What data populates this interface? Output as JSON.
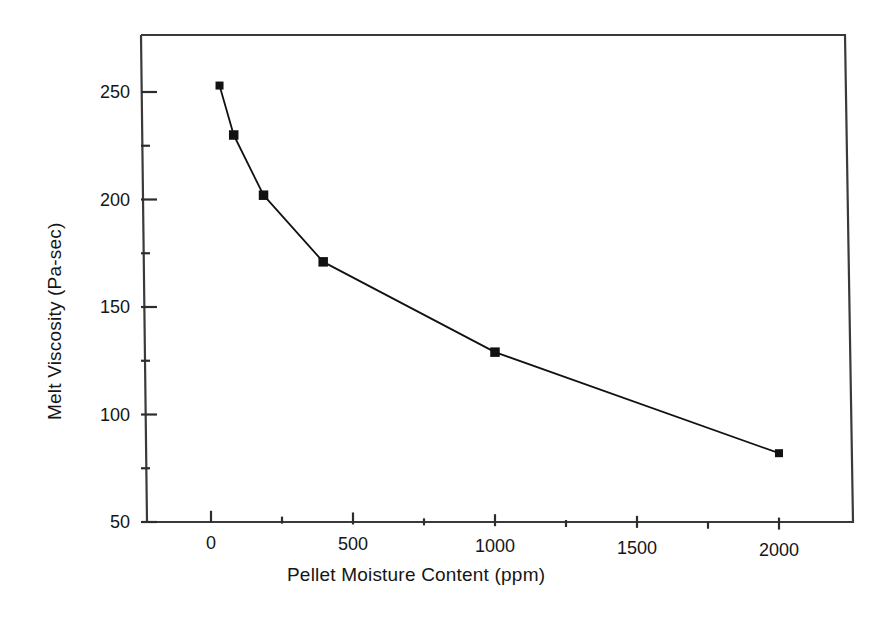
{
  "chart_data": {
    "type": "line",
    "title": "",
    "subtitle": "",
    "xlabel": "Pellet Moisture Content (ppm)",
    "ylabel": "Melt Viscosity (Pa-sec)",
    "xlim": [
      -160,
      2180
    ],
    "ylim": [
      50,
      260
    ],
    "xticks": [
      0,
      500,
      1000,
      1500,
      2000
    ],
    "xtick_labels": [
      "0",
      "500",
      "1000",
      "1500",
      "2000"
    ],
    "xminor_ticks": [
      250,
      750,
      1250,
      1750
    ],
    "yticks": [
      50,
      100,
      150,
      200,
      250
    ],
    "ytick_labels": [
      "50",
      "100",
      "150",
      "200",
      "250"
    ],
    "yminor_ticks": [
      75,
      125,
      175,
      225
    ],
    "grid": false,
    "legend": null,
    "series": [
      {
        "name": "Melt Viscosity",
        "marker": "square",
        "color": "#111111",
        "x": [
          30,
          80,
          185,
          395,
          1000,
          2000
        ],
        "y": [
          253,
          230,
          202,
          171,
          129,
          82
        ]
      }
    ],
    "annotations": []
  },
  "axes": {
    "x_title": "Pellet Moisture Content (ppm)",
    "y_title": "Melt Viscosity (Pa-sec)"
  },
  "style": {
    "line_color": "#111111",
    "marker_color": "#111111",
    "frame_color": "#333333",
    "background": "#ffffff"
  }
}
